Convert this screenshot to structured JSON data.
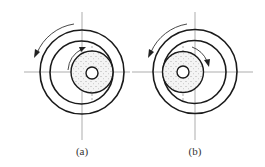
{
  "figure": {
    "panels": [
      {
        "id": "a",
        "caption": "(a)",
        "center": [
          82,
          72
        ],
        "outer_ring_radius": 42,
        "inner_ring_radius": 31.5,
        "wheel_center": [
          92,
          72
        ],
        "wheel_radius": 21,
        "hub_radius": 6,
        "outer_rotation": "counterclockwise",
        "wheel_rotation": "clockwise",
        "wheel_contact_side": "right"
      },
      {
        "id": "b",
        "caption": "(b)",
        "center": [
          195,
          72
        ],
        "outer_ring_radius": 42,
        "inner_ring_radius": 31.5,
        "wheel_center": [
          183,
          72
        ],
        "wheel_radius": 21,
        "hub_radius": 6,
        "outer_rotation": "counterclockwise",
        "wheel_rotation": "clockwise",
        "wheel_contact_side": "left"
      }
    ],
    "colors": {
      "line": "#1a1a1a",
      "axis": "#8a8a8a",
      "background": "#ffffff"
    }
  }
}
